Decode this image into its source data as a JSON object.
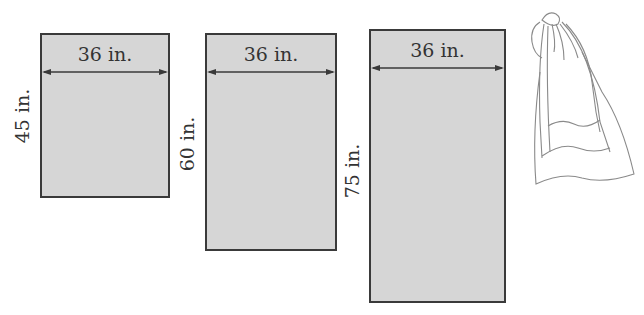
{
  "figure": {
    "panels": [
      {
        "width_label": "36 in.",
        "height_label": "45 in."
      },
      {
        "width_label": "36 in.",
        "height_label": "60 in."
      },
      {
        "width_label": "36 in.",
        "height_label": "75 in."
      }
    ],
    "illustration": "drawstring-bag-sketch",
    "colors": {
      "fill": "#d6d6d6",
      "stroke": "#3a3a3a",
      "text": "#333333"
    }
  }
}
